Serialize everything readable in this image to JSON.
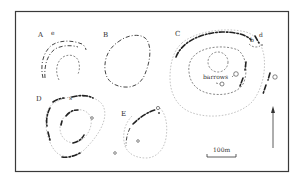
{
  "figure": {
    "type": "archaeological site plan",
    "sites": [
      {
        "id": "A",
        "label": "A",
        "sub_labels": [
          "e"
        ]
      },
      {
        "id": "B",
        "label": "B"
      },
      {
        "id": "C",
        "label": "C",
        "sub_labels": [
          "b",
          "d"
        ],
        "annotation": "barrows"
      },
      {
        "id": "D",
        "label": "D",
        "sub_labels": [
          "s"
        ]
      },
      {
        "id": "E",
        "label": "E"
      }
    ],
    "scale_bar": {
      "label": "100m"
    },
    "north_arrow": {
      "direction": "north"
    }
  }
}
